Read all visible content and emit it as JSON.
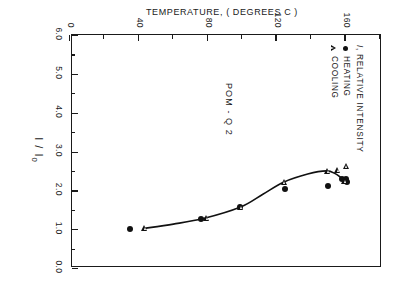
{
  "figure": {
    "sample_label": "POM - Q 2",
    "orientation": "rotated-90",
    "ink_color": "#1a1a1a"
  },
  "legend": {
    "title_symbol": "I",
    "title_text": ", RELATIVE  INTENSITY",
    "entries": [
      {
        "marker": "filled-circle",
        "label": "HEATING"
      },
      {
        "marker": "open-triangle",
        "label": "COOLING"
      }
    ]
  },
  "chart_data": {
    "type": "scatter",
    "title": "",
    "subtitle": "POM - Q 2",
    "xlabel": "TEMPERATURE, ( DEGREES  C )",
    "ylabel": "I / I₀",
    "xlim": [
      0,
      180
    ],
    "ylim": [
      0,
      6.0
    ],
    "grid": false,
    "legend_position": "upper-left-inside",
    "x_ticks": [
      0,
      40,
      80,
      120,
      160
    ],
    "x_tick_labels": [
      "0",
      "40",
      "80",
      "120",
      "160"
    ],
    "x_minor_ticks": [
      20,
      60,
      100,
      140,
      180
    ],
    "y_ticks": [
      0.0,
      1.0,
      2.0,
      3.0,
      4.0,
      5.0,
      6.0
    ],
    "y_tick_labels": [
      "0.0",
      "1.0",
      "2.0",
      "3.0",
      "4.0",
      "5.0",
      "6.0"
    ],
    "y_minor_ticks": [
      0.5,
      1.5,
      2.5,
      3.5,
      4.5,
      5.5
    ],
    "series": [
      {
        "name": "HEATING",
        "marker": "filled-circle",
        "points": [
          {
            "x": 35,
            "y": 1.0
          },
          {
            "x": 76,
            "y": 1.27
          },
          {
            "x": 99,
            "y": 1.57
          },
          {
            "x": 125,
            "y": 2.03
          },
          {
            "x": 150,
            "y": 2.12
          },
          {
            "x": 158,
            "y": 2.28
          },
          {
            "x": 160,
            "y": 2.3
          },
          {
            "x": 161,
            "y": 2.22
          }
        ]
      },
      {
        "name": "COOLING",
        "marker": "open-triangle",
        "points": [
          {
            "x": 43,
            "y": 1.03
          },
          {
            "x": 79,
            "y": 1.29
          },
          {
            "x": 99,
            "y": 1.57
          },
          {
            "x": 124,
            "y": 2.22
          },
          {
            "x": 149,
            "y": 2.5
          },
          {
            "x": 155,
            "y": 2.52
          },
          {
            "x": 159,
            "y": 2.25
          },
          {
            "x": 160,
            "y": 2.62
          }
        ]
      }
    ],
    "fitted_curve": [
      {
        "x": 43,
        "y": 1.02
      },
      {
        "x": 60,
        "y": 1.13
      },
      {
        "x": 78,
        "y": 1.28
      },
      {
        "x": 99,
        "y": 1.57
      },
      {
        "x": 112,
        "y": 1.9
      },
      {
        "x": 124,
        "y": 2.21
      },
      {
        "x": 138,
        "y": 2.42
      },
      {
        "x": 149,
        "y": 2.5
      },
      {
        "x": 154,
        "y": 2.43
      },
      {
        "x": 157,
        "y": 2.34
      },
      {
        "x": 159,
        "y": 2.28
      }
    ]
  }
}
